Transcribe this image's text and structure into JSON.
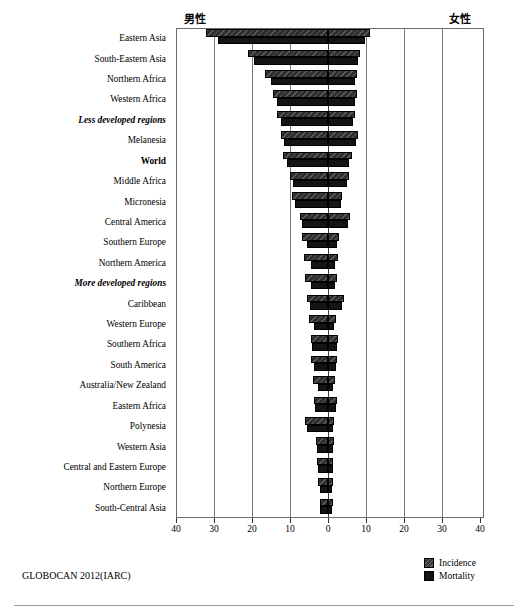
{
  "header": {
    "male_label": "男性",
    "female_label": "女性"
  },
  "source_note": "GLOBOCAN 2012(IARC)",
  "legend": {
    "items": [
      {
        "label": "Incidence",
        "color": "#3a3a3a"
      },
      {
        "label": "Mortality",
        "color": "#141414"
      }
    ]
  },
  "axis": {
    "tick_labels": [
      "40",
      "30",
      "20",
      "10",
      "0",
      "10",
      "20",
      "30",
      "40"
    ],
    "tick_values": [
      -40,
      -30,
      -20,
      -10,
      0,
      10,
      20,
      30,
      40
    ]
  },
  "chart_data": {
    "type": "bar",
    "orientation": "horizontal",
    "style": "population-pyramid",
    "title": "",
    "subtitle": "",
    "xlabel": "",
    "ylabel": "",
    "xlim": [
      -40,
      40
    ],
    "grid": true,
    "legend_position": "bottom-right",
    "left_panel_label": "男性",
    "right_panel_label": "女性",
    "axis_tick_labels": [
      "40",
      "30",
      "20",
      "10",
      "0",
      "10",
      "20",
      "30",
      "40"
    ],
    "note": "Age-standardised rates per 100,000. Left = male, right = female. Each category has two bars: Incidence (hatched) and Mortality (solid).",
    "categories": [
      "Eastern Asia",
      "South-Eastern Asia",
      "Northern Africa",
      "Western Africa",
      "Less developed regions",
      "Melanesia",
      "World",
      "Middle Africa",
      "Micronesia",
      "Central America",
      "Southern Europe",
      "Northern America",
      "More developed regions",
      "Caribbean",
      "Western Europe",
      "Southern Africa",
      "South America",
      "Australia/New Zealand",
      "Eastern Africa",
      "Polynesia",
      "Western Asia",
      "Central and Eastern Europe",
      "Northern Europe",
      "South-Central Asia"
    ],
    "emphasis": {
      "Less developed regions": "bold-italic",
      "World": "bold",
      "More developed regions": "bold-italic"
    },
    "series": [
      {
        "name": "Incidence",
        "side": "male",
        "values": [
          32.0,
          21.0,
          16.5,
          14.5,
          13.5,
          12.5,
          11.8,
          10.0,
          9.5,
          7.5,
          6.8,
          6.2,
          6.0,
          5.5,
          5.0,
          4.6,
          4.4,
          4.0,
          3.7,
          6.0,
          3.2,
          3.0,
          2.6,
          2.2
        ]
      },
      {
        "name": "Mortality",
        "side": "male",
        "values": [
          29.0,
          19.5,
          15.0,
          13.5,
          12.5,
          11.5,
          10.8,
          9.2,
          8.8,
          6.8,
          5.6,
          4.5,
          4.6,
          4.8,
          3.6,
          4.2,
          3.8,
          2.6,
          3.4,
          5.6,
          2.9,
          2.6,
          2.0,
          2.0
        ]
      },
      {
        "name": "Incidence",
        "side": "female",
        "values": [
          11.0,
          8.5,
          7.5,
          7.5,
          7.2,
          8.0,
          6.2,
          5.4,
          3.8,
          5.8,
          3.0,
          2.6,
          2.4,
          4.2,
          2.0,
          2.6,
          2.4,
          1.8,
          2.4,
          1.6,
          1.6,
          1.4,
          1.4,
          1.2
        ]
      },
      {
        "name": "Mortality",
        "side": "female",
        "values": [
          9.8,
          7.8,
          7.0,
          7.0,
          6.6,
          7.4,
          5.6,
          5.0,
          3.4,
          5.2,
          2.4,
          1.8,
          1.8,
          3.6,
          1.5,
          2.3,
          2.0,
          1.2,
          2.2,
          1.4,
          1.4,
          1.2,
          1.0,
          1.0
        ]
      }
    ]
  }
}
